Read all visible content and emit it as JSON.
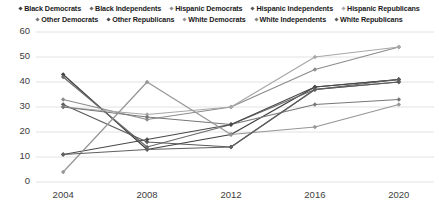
{
  "chart_data": {
    "type": "line",
    "title": "",
    "subtitle": "",
    "xlabel": "",
    "ylabel": "",
    "categories": [
      "2004",
      "2008",
      "2012",
      "2016",
      "2020"
    ],
    "x": [
      2004,
      2008,
      2012,
      2016,
      2020
    ],
    "ylim": [
      0,
      60
    ],
    "ytick_labels": [
      "0",
      "10",
      "20",
      "30",
      "40",
      "50",
      "60"
    ],
    "yticks": [
      0,
      10,
      20,
      30,
      40,
      50,
      60
    ],
    "grid": true,
    "grid_axis": "y",
    "legend_position": "top",
    "marker": "diamond",
    "series": [
      {
        "name": "Black Democrats",
        "color": "#3f3f3f",
        "values": [
          43,
          13,
          19,
          38,
          41
        ]
      },
      {
        "name": "Black Independents",
        "color": "#6b6b6b",
        "values": [
          42,
          14,
          23,
          37,
          40
        ]
      },
      {
        "name": "Hispanic Democrats",
        "color": "#8c8c8c",
        "values": [
          33,
          25,
          30,
          45,
          54
        ]
      },
      {
        "name": "Hispanic Independents",
        "color": "#5a5a5a",
        "values": [
          31,
          16,
          14,
          37,
          40
        ]
      },
      {
        "name": "Hispanic Republicans",
        "color": "#a8a8a8",
        "values": [
          30,
          27,
          30,
          50,
          54
        ]
      },
      {
        "name": "Other Democrats",
        "color": "#777777",
        "values": [
          30,
          26,
          23,
          31,
          33
        ]
      },
      {
        "name": "Other Republicans",
        "color": "#4a4a4a",
        "values": [
          11,
          17,
          23,
          38,
          41
        ]
      },
      {
        "name": "White Democrats",
        "color": "#969696",
        "values": [
          4,
          40,
          19,
          22,
          31
        ]
      },
      {
        "name": "White Republicans",
        "color": "#5f5f5f",
        "values": [
          11,
          13,
          14,
          37,
          41
        ]
      }
    ]
  },
  "legend": {
    "items": [
      {
        "label": "Black Democrats",
        "color": "#3f3f3f"
      },
      {
        "label": "Black Independents",
        "color": "#6b6b6b"
      },
      {
        "label": "Hispanic Democrats",
        "color": "#8c8c8c"
      },
      {
        "label": "Hispanic Independents",
        "color": "#5a5a5a"
      },
      {
        "label": "Hispanic Republicans",
        "color": "#a8a8a8"
      },
      {
        "label": "Other Democrats",
        "color": "#777777"
      },
      {
        "label": "Other Republicans",
        "color": "#4a4a4a"
      },
      {
        "label": "White Democrats",
        "color": "#969696"
      },
      {
        "label": "White Independents",
        "color": "#838383"
      },
      {
        "label": "White Republicans",
        "color": "#5f5f5f"
      }
    ]
  },
  "colors": {
    "background": "#ffffff",
    "gridline": "#e2e2e2",
    "tick_text": "#3d3d3d",
    "legend_text": "#1a1a1a"
  }
}
